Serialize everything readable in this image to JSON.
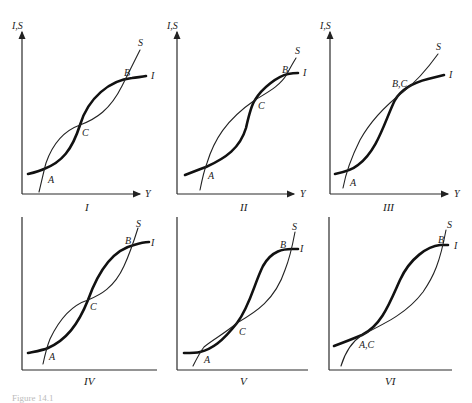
{
  "figure": {
    "caption": "Figure 14.1",
    "y_axis_label": "I,S",
    "x_axis_label": "Y",
    "curve_labels": {
      "investment": "I",
      "saving": "S"
    },
    "panels": [
      {
        "id": "I",
        "roman": "I",
        "points": {
          "A": "A",
          "B": "B",
          "C": "C"
        }
      },
      {
        "id": "II",
        "roman": "II",
        "points": {
          "A": "A",
          "B": "B",
          "C": "C"
        }
      },
      {
        "id": "III",
        "roman": "III",
        "points": {
          "A": "A",
          "BC": "B,C"
        }
      },
      {
        "id": "IV",
        "roman": "IV",
        "points": {
          "A": "A",
          "B": "B",
          "C": "C"
        }
      },
      {
        "id": "V",
        "roman": "V",
        "points": {
          "A": "A",
          "B": "B",
          "C": "C"
        }
      },
      {
        "id": "VI",
        "roman": "VI",
        "points": {
          "AC": "A,C",
          "B": "B"
        }
      }
    ]
  }
}
